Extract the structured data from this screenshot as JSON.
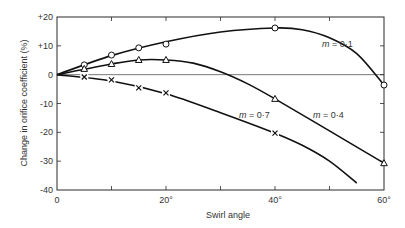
{
  "chart_data": {
    "type": "line",
    "title": "",
    "xlabel": "Swirl angle",
    "ylabel": "Change in orifice coefficient (%)",
    "xlim": [
      0,
      60
    ],
    "ylim": [
      -40,
      20
    ],
    "x_ticks": [
      0,
      10,
      20,
      30,
      40,
      50,
      60
    ],
    "x_tick_labels": [
      {
        "value": 0,
        "label": "0"
      },
      {
        "value": 20,
        "label": "20°"
      },
      {
        "value": 40,
        "label": "40°"
      },
      {
        "value": 60,
        "label": "60°"
      }
    ],
    "y_ticks": [
      {
        "value": 20,
        "label": "+20"
      },
      {
        "value": 10,
        "label": "+10"
      },
      {
        "value": 0,
        "label": "0"
      },
      {
        "value": -10,
        "label": "-10"
      },
      {
        "value": -20,
        "label": "-20"
      },
      {
        "value": -30,
        "label": "-30"
      },
      {
        "value": -40,
        "label": "-40"
      }
    ],
    "grid": false,
    "zero_line": true,
    "legend": "inline labels",
    "series": [
      {
        "name": "m = 0·1",
        "marker": "circle",
        "points": [
          [
            5,
            3.4
          ],
          [
            10,
            6.8
          ],
          [
            15,
            9.3
          ],
          [
            20,
            10.6
          ],
          [
            40,
            16.2
          ],
          [
            60,
            -3.6
          ]
        ],
        "curve": [
          [
            0,
            0
          ],
          [
            10,
            6.6
          ],
          [
            20,
            11.4
          ],
          [
            30,
            14.8
          ],
          [
            40,
            16.2
          ],
          [
            45,
            15.6
          ],
          [
            50,
            12.8
          ],
          [
            55,
            7.3
          ],
          [
            60,
            -3.6
          ]
        ]
      },
      {
        "name": "m = 0·4",
        "marker": "triangle",
        "points": [
          [
            5,
            2.0
          ],
          [
            10,
            3.7
          ],
          [
            15,
            5.1
          ],
          [
            20,
            5.1
          ],
          [
            40,
            -8.4
          ],
          [
            60,
            -30.7
          ]
        ],
        "curve": [
          [
            0,
            0
          ],
          [
            10,
            3.7
          ],
          [
            15,
            5.1
          ],
          [
            20,
            5.1
          ],
          [
            25,
            4.0
          ],
          [
            30,
            1.0
          ],
          [
            35,
            -3.2
          ],
          [
            40,
            -8.4
          ],
          [
            50,
            -19.5
          ],
          [
            60,
            -30.7
          ]
        ]
      },
      {
        "name": "m = 0·7",
        "marker": "cross",
        "points": [
          [
            5,
            -0.8
          ],
          [
            10,
            -1.8
          ],
          [
            15,
            -4.6
          ],
          [
            20,
            -6.3
          ],
          [
            40,
            -20.3
          ]
        ],
        "curve": [
          [
            0,
            0
          ],
          [
            10,
            -2.2
          ],
          [
            20,
            -6.6
          ],
          [
            30,
            -13.2
          ],
          [
            40,
            -20.3
          ],
          [
            45,
            -24.5
          ],
          [
            50,
            -30.0
          ],
          [
            55,
            -37.6
          ]
        ]
      }
    ]
  },
  "labels": {
    "m01": {
      "var": "m",
      "rest": " = 0·1"
    },
    "m04": {
      "var": "m",
      "rest": " = 0·4"
    },
    "m07": {
      "var": "m",
      "rest": " = 0·7"
    }
  }
}
